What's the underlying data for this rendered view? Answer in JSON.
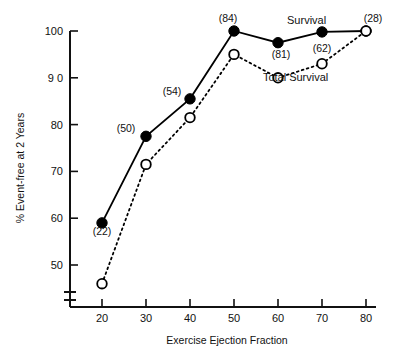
{
  "chart_data": {
    "type": "line",
    "title": "",
    "xlabel": "Exercise Ejection Fraction",
    "ylabel": "% Event-free at 2 Years",
    "xlim": [
      15,
      82
    ],
    "ylim": [
      44,
      101
    ],
    "grid": false,
    "legend_position": "inline-annotation",
    "y_axis_break": true,
    "xticks": [
      "20",
      "30",
      "40",
      "50",
      "60",
      "70",
      "80"
    ],
    "xtick_values": [
      20,
      30,
      40,
      50,
      60,
      70,
      80
    ],
    "yticks": [
      "50",
      "60",
      "70",
      "80",
      "9 0",
      "100"
    ],
    "ytick_values": [
      50,
      60,
      70,
      80,
      90,
      100
    ],
    "x": [
      20,
      30,
      40,
      50,
      60,
      70,
      80
    ],
    "series": [
      {
        "name": "Survival",
        "marker": "filled-circle",
        "linestyle": "solid",
        "color": "#000000",
        "values": [
          59,
          77.5,
          85.5,
          100,
          97.5,
          99.8,
          100
        ],
        "point_labels": [
          "(22)",
          "(50)",
          "(54)",
          "(84)",
          "(81)",
          "(62)",
          "(28)"
        ]
      },
      {
        "name": "Total Survival",
        "marker": "open-circle",
        "linestyle": "dotted",
        "color": "#000000",
        "values": [
          46,
          71.5,
          81.5,
          95,
          90,
          93,
          100
        ],
        "point_labels": [
          "",
          "",
          "",
          "",
          "",
          "",
          ""
        ]
      }
    ],
    "annotations": [
      {
        "text": "Survival",
        "x": 66.5,
        "y": 101.6
      },
      {
        "text": "Total Survival",
        "x": 64.0,
        "y": 89.3
      }
    ],
    "point_label_positions": [
      {
        "text": "(22)",
        "px": 102,
        "py": 235
      },
      {
        "text": "(50)",
        "px": 126,
        "py": 132
      },
      {
        "text": "(54)",
        "px": 172,
        "py": 95
      },
      {
        "text": "(84)",
        "px": 228,
        "py": 22
      },
      {
        "text": "(81)",
        "px": 281,
        "py": 58
      },
      {
        "text": "(62)",
        "px": 322,
        "py": 52
      },
      {
        "text": "(28)",
        "px": 373,
        "py": 22
      }
    ]
  }
}
